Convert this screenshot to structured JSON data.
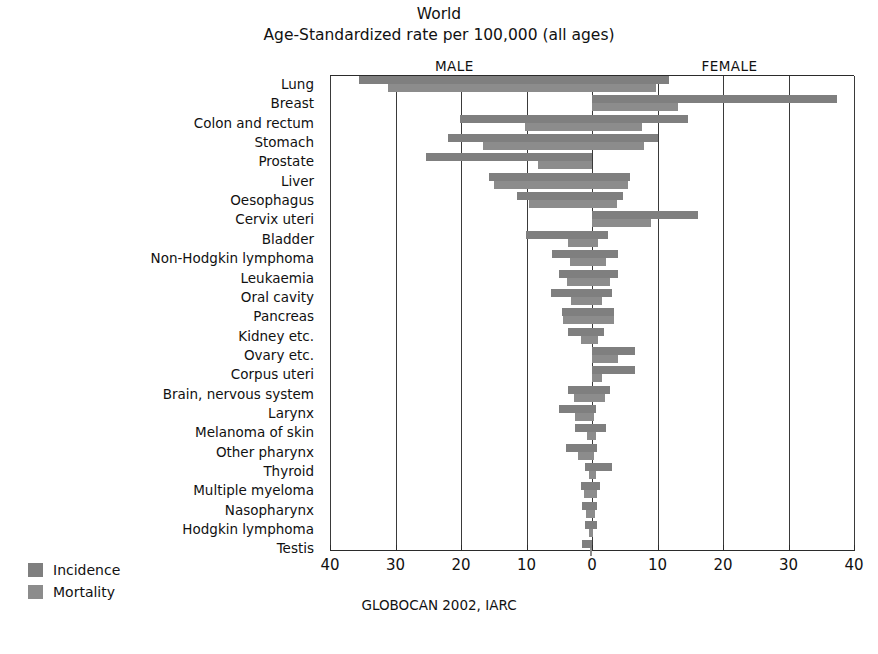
{
  "titles": {
    "line1": "World",
    "line2": "Age-Standardized rate per 100,000 (all ages)"
  },
  "headers": {
    "male": "MALE",
    "female": "FEMALE"
  },
  "legend": {
    "incidence": "Incidence",
    "mortality": "Mortality"
  },
  "source": "GLOBOCAN 2002, IARC",
  "caption": "",
  "axis": {
    "ticks": [
      "40",
      "30",
      "20",
      "10",
      "0",
      "10",
      "20",
      "30",
      "40"
    ]
  },
  "colors": {
    "incidence": "#7f7f7f",
    "mortality": "#8c8c8c",
    "axis": "#2b2b2b",
    "grid": "#3a3a3a",
    "text": "#111111",
    "background": "#ffffff"
  },
  "chart_data": {
    "type": "bar",
    "orientation": "horizontal",
    "subtype": "population-pyramid / back-to-back bar",
    "xlabel": "Age-standardized rate per 100,000",
    "ylabel": "",
    "xlim": [
      -40,
      40
    ],
    "xticks": [
      -40,
      -30,
      -20,
      -10,
      0,
      10,
      20,
      30,
      40
    ],
    "xticklabels": [
      "40",
      "30",
      "20",
      "10",
      "0",
      "10",
      "20",
      "30",
      "40"
    ],
    "grid": true,
    "legend_position": "bottom-left",
    "left_panel": "MALE",
    "right_panel": "FEMALE",
    "source": "GLOBOCAN 2002, IARC",
    "categories": [
      "Lung",
      "Breast",
      "Colon and rectum",
      "Stomach",
      "Prostate",
      "Liver",
      "Oesophagus",
      "Cervix uteri",
      "Bladder",
      "Non-Hodgkin lymphoma",
      "Leukaemia",
      "Oral cavity",
      "Pancreas",
      "Kidney etc.",
      "Ovary etc.",
      "Corpus uteri",
      "Brain, nervous system",
      "Larynx",
      "Melanoma of skin",
      "Other pharynx",
      "Thyroid",
      "Multiple myeloma",
      "Nasopharynx",
      "Hodgkin lymphoma",
      "Testis"
    ],
    "series": [
      {
        "name": "Male incidence",
        "side": "left",
        "measure": "incidence",
        "values": [
          35.5,
          0.0,
          20.1,
          22.0,
          25.3,
          15.8,
          11.5,
          0.0,
          10.1,
          6.1,
          5.0,
          6.3,
          4.6,
          3.6,
          0.0,
          0.0,
          3.7,
          5.0,
          2.6,
          4.0,
          1.0,
          1.7,
          1.6,
          1.0,
          1.5
        ],
        "color": "#7f7f7f"
      },
      {
        "name": "Male mortality",
        "side": "left",
        "measure": "mortality",
        "values": [
          31.2,
          0.0,
          10.2,
          16.7,
          8.3,
          14.9,
          9.6,
          0.0,
          3.6,
          3.3,
          3.8,
          3.2,
          4.4,
          1.7,
          0.0,
          0.0,
          2.7,
          2.6,
          0.8,
          2.2,
          0.4,
          1.2,
          0.9,
          0.4,
          0.3
        ],
        "color": "#8c8c8c"
      },
      {
        "name": "Female incidence",
        "side": "right",
        "measure": "incidence",
        "values": [
          11.7,
          37.4,
          14.6,
          10.0,
          0.0,
          5.8,
          4.7,
          16.2,
          2.5,
          4.0,
          3.9,
          3.0,
          3.4,
          1.9,
          6.6,
          6.5,
          2.8,
          0.6,
          2.2,
          0.7,
          3.0,
          1.2,
          0.7,
          0.7,
          0.0
        ],
        "color": "#7f7f7f"
      },
      {
        "name": "Female mortality",
        "side": "right",
        "measure": "mortality",
        "values": [
          9.8,
          13.2,
          7.6,
          8.0,
          0.0,
          5.5,
          3.8,
          9.0,
          0.9,
          2.2,
          2.8,
          1.5,
          3.3,
          0.9,
          3.9,
          1.6,
          2.0,
          0.3,
          0.6,
          0.3,
          0.6,
          0.8,
          0.4,
          0.2,
          0.0
        ],
        "color": "#8c8c8c"
      }
    ]
  }
}
